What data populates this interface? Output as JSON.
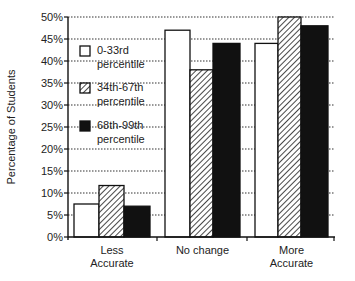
{
  "chart_data": {
    "type": "bar",
    "title": "",
    "xlabel": "",
    "ylabel": "Percentage of Students",
    "ylim": [
      0,
      50
    ],
    "yticks": [
      "0%",
      "5%",
      "10%",
      "15%",
      "20%",
      "25%",
      "30%",
      "35%",
      "40%",
      "45%",
      "50%"
    ],
    "grid": "dotted horizontal",
    "categories": [
      {
        "line1": "Less",
        "line2": "Accurate"
      },
      {
        "line1": "No change",
        "line2": ""
      },
      {
        "line1": "More",
        "line2": "Accurate"
      }
    ],
    "series": [
      {
        "name": "0-33rd percentile",
        "line1": "0-33rd",
        "line2": "percentile",
        "fill": "white",
        "values": [
          7.5,
          47,
          44
        ]
      },
      {
        "name": "34th-67th percentile",
        "line1": "34th-67th",
        "line2": "percentile",
        "fill": "hatched",
        "values": [
          11.7,
          38,
          50
        ]
      },
      {
        "name": "68th-99th percentile",
        "line1": "68th-99th",
        "line2": "percentile",
        "fill": "black",
        "values": [
          7,
          44,
          48
        ]
      }
    ],
    "legend_position": "upper-left inside plot"
  }
}
